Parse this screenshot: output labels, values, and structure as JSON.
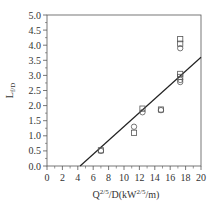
{
  "chart_data": {
    "type": "scatter",
    "title": "",
    "xlabel": "Q^{2/5}/D(kW^{2/5}/m)",
    "xlabel_parts": {
      "base": "Q",
      "sup1": "2/5",
      "mid": "/D(kW",
      "sup2": "2/5",
      "end": "/m)"
    },
    "ylabel": "L_{f/D}",
    "ylabel_parts": {
      "base": "L",
      "sub": "f/D"
    },
    "xlim": [
      0,
      20
    ],
    "ylim": [
      0.0,
      5.0
    ],
    "xticks": [
      0,
      2,
      4,
      6,
      8,
      10,
      12,
      14,
      16,
      18,
      20
    ],
    "yticks": [
      "0.0",
      "0.5",
      "1.0",
      "1.5",
      "2.0",
      "2.5",
      "3.0",
      "3.5",
      "4.0",
      "4.5",
      "5.0"
    ],
    "grid": false,
    "legend": null,
    "series": [
      {
        "name": "squares",
        "marker": "square",
        "points": [
          {
            "x": 7.0,
            "y": 0.52
          },
          {
            "x": 11.3,
            "y": 1.1
          },
          {
            "x": 12.4,
            "y": 1.9
          },
          {
            "x": 14.8,
            "y": 1.87
          },
          {
            "x": 17.3,
            "y": 4.2
          },
          {
            "x": 17.3,
            "y": 4.05
          },
          {
            "x": 17.3,
            "y": 3.05
          },
          {
            "x": 17.3,
            "y": 2.95
          }
        ]
      },
      {
        "name": "circles",
        "marker": "circle",
        "points": [
          {
            "x": 7.0,
            "y": 0.5
          },
          {
            "x": 11.3,
            "y": 1.3
          },
          {
            "x": 12.4,
            "y": 1.78
          },
          {
            "x": 14.8,
            "y": 1.85
          },
          {
            "x": 17.3,
            "y": 3.9
          },
          {
            "x": 17.3,
            "y": 2.85
          },
          {
            "x": 17.3,
            "y": 2.78
          }
        ]
      }
    ],
    "fit_line": {
      "x1": 4.3,
      "y1": 0.0,
      "x2": 20.0,
      "y2": 3.6
    }
  },
  "colors": {
    "axis": "#555555",
    "line": "#222222",
    "marker": "#555555"
  }
}
